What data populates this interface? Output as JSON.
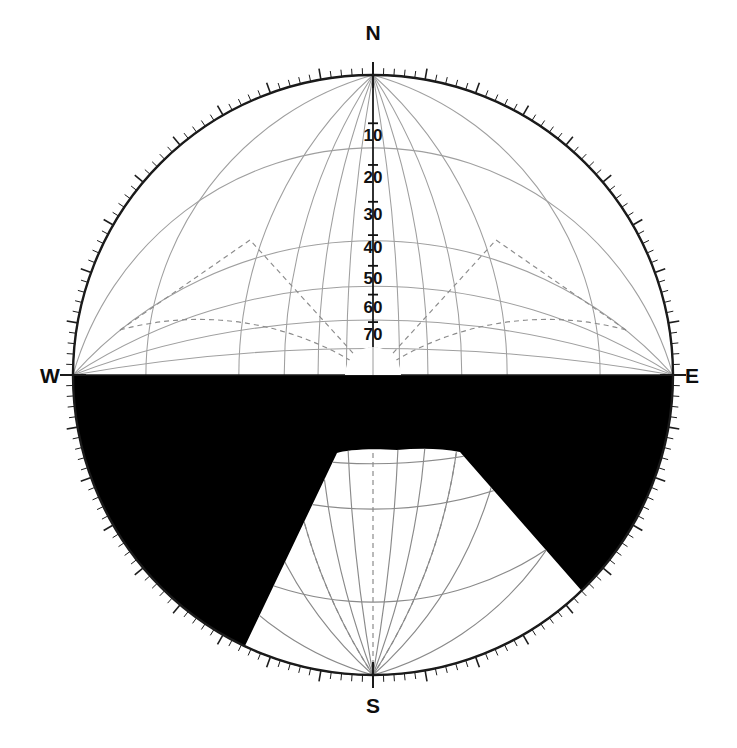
{
  "figure": {
    "type": "stereonet-shading-diagram",
    "projection": "equal-angle stereographic (Wulff net)",
    "background_color": "#ffffff",
    "shading_color": "#000000",
    "grid_color": "#9a9a9a",
    "outline_color": "#1a1a1a",
    "caption_partial": "",
    "center": {
      "x": 373,
      "y": 375
    },
    "radius": 300
  },
  "cardinals": {
    "north": "N",
    "east": "E",
    "south": "S",
    "west": "W"
  },
  "chart_data": {
    "type": "scatter",
    "title": "",
    "xlabel": "",
    "ylabel": "",
    "projection": "stereographic lower-hemisphere net",
    "net_type": "Wulff (equal-angle)",
    "grid_interval_degrees": 10,
    "primitive_circle_radius_px": 300,
    "center_px": [
      373,
      375
    ],
    "azimuth_labels": [
      "N",
      "E",
      "S",
      "W"
    ],
    "azimuth_label_angles_deg": [
      0,
      90,
      180,
      270
    ],
    "dip_scale": {
      "label_axis": "north radius (vertical, center upward)",
      "ticks": [
        10,
        20,
        30,
        40,
        50,
        60,
        70,
        80
      ],
      "tick_unit": "degrees",
      "direction": "outer rim = 10, center = 90"
    },
    "tick_marks": {
      "perimeter_ticks_every_degrees": 2,
      "major_tick_every_degrees": 10
    },
    "shaded_regions": [
      {
        "name": "southern-hemisphere-shading",
        "fill": "#000000",
        "description": "entire lower half of the net, bounded above by the W-E horizontal diameter",
        "bounded_by": "W-E diameter and the primitive circle"
      }
    ],
    "unshaded_cutouts": [
      {
        "name": "south-wedge-cutout",
        "fill": "#ffffff",
        "description": "white wedge opening toward S, apex near net center, widening to the primitive circle",
        "apex_px": [
          397,
          450
        ],
        "left_rim_intersection_px": [
          243,
          650
        ],
        "right_rim_intersection_px": [
          588,
          598
        ],
        "approx_azimuth_span_deg": [
          152,
          219
        ],
        "apex_top_arc": true
      }
    ],
    "dashed_construction_lines": [
      {
        "name": "upper-left-dashed-great-circle",
        "style": "dashed"
      },
      {
        "name": "upper-right-dashed-great-circle",
        "style": "dashed"
      }
    ],
    "legend": [],
    "annotations": []
  }
}
